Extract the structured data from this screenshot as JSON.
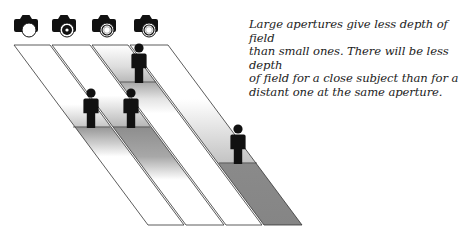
{
  "caption": {
    "lines": [
      "Large apertures give less depth of field",
      "than small ones. There will be less depth",
      "of field for a close subject than for a",
      "distant one at the same aperture."
    ]
  },
  "cameras": [
    {
      "id": "camera-1",
      "aperture": "wide-open",
      "x": 26
    },
    {
      "id": "camera-2",
      "aperture": "small",
      "x": 64
    },
    {
      "id": "camera-3",
      "aperture": "medium",
      "x": 104
    },
    {
      "id": "camera-4",
      "aperture": "medium",
      "x": 146
    }
  ],
  "strips": [
    {
      "id": "strip-1",
      "top_left": 14,
      "top_right": 50,
      "subject_y": 127,
      "zone": "shallow"
    },
    {
      "id": "strip-2",
      "top_left": 52,
      "top_right": 90,
      "subject_y": 127,
      "zone": "deep"
    },
    {
      "id": "strip-3",
      "top_left": 92,
      "top_right": 128,
      "subject_y": 82,
      "zone": "deep-close"
    },
    {
      "id": "strip-4",
      "top_left": 130,
      "top_right": 168,
      "subject_y": 163,
      "zone": "deep-far"
    }
  ],
  "colors": {
    "outline": "#333333",
    "figure": "#111111",
    "zone_dark": "#8c8c8c",
    "zone_light": "#ffffff"
  }
}
